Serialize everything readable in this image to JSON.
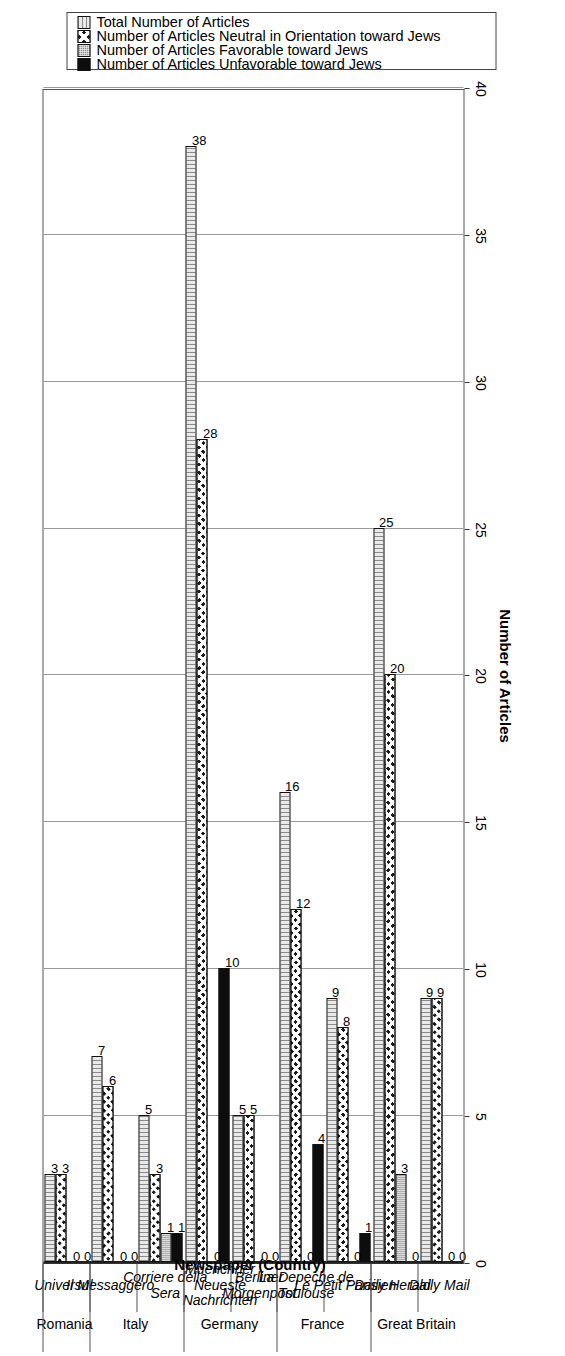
{
  "chart_data": {
    "type": "bar",
    "title": "",
    "xlabel": "Newspaper (Country)",
    "ylabel": "Number of Articles",
    "ylim": [
      0,
      40
    ],
    "ytick_labels": [
      "0",
      "5",
      "10",
      "15",
      "20",
      "25",
      "30",
      "35",
      "40"
    ],
    "ytick_values": [
      0,
      5,
      10,
      15,
      20,
      25,
      30,
      35,
      40
    ],
    "grid": true,
    "orientation": "vertical-bars-rotated-page",
    "legend_position": "right",
    "categories": [
      "Daily Mail",
      "Daily Herald",
      "Le Petit Parisien",
      "La Depeche de Toulouse",
      "Berliner Morgenpost",
      "Muenchner Neueste Nachrichten",
      "Corriere della Sera",
      "Il Messaggero",
      "Universul"
    ],
    "country_groups": [
      {
        "name": "Great Britain",
        "categories": [
          "Daily Mail",
          "Daily Herald"
        ]
      },
      {
        "name": "France",
        "categories": [
          "Le Petit Parisien",
          "La Depeche de Toulouse"
        ]
      },
      {
        "name": "Germany",
        "categories": [
          "Berliner Morgenpost",
          "Muenchner Neueste Nachrichten"
        ]
      },
      {
        "name": "Italy",
        "categories": [
          "Corriere della Sera",
          "Il Messaggero"
        ]
      },
      {
        "name": "Romania",
        "categories": [
          "Universul"
        ]
      }
    ],
    "series": [
      {
        "name": "Number of Articles Unfavorable toward Jews",
        "pattern": "solid-black",
        "values": [
          0,
          0,
          1,
          4,
          0,
          10,
          1,
          0,
          0
        ]
      },
      {
        "name": "Number of Articles Favorable toward Jews",
        "pattern": "fine-dotted-gray",
        "values": [
          0,
          3,
          0,
          0,
          0,
          0,
          1,
          0,
          0
        ]
      },
      {
        "name": "Number of Articles Neutral in Orientation toward Jews",
        "pattern": "crosshatch",
        "values": [
          9,
          20,
          8,
          12,
          5,
          28,
          3,
          6,
          3
        ]
      },
      {
        "name": "Total Number of Articles",
        "pattern": "vertical-lines",
        "values": [
          9,
          25,
          9,
          16,
          5,
          38,
          5,
          7,
          3
        ]
      }
    ]
  },
  "legend": {
    "items": [
      {
        "label": "Number of Articles Unfavorable toward Jews",
        "swatch": "solid-black"
      },
      {
        "label": "Number of Articles Favorable toward Jews",
        "swatch": "fine-dotted-gray"
      },
      {
        "label": "Number of Articles Neutral in Orientation toward Jews",
        "swatch": "crosshatch"
      },
      {
        "label": "Total Number of Articles",
        "swatch": "vertical-lines"
      }
    ]
  },
  "axes": {
    "value_axis_title": "Number of Articles",
    "category_axis_title": "Newspaper (Country)"
  }
}
